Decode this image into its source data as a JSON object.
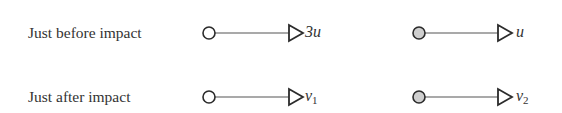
{
  "diagram": {
    "rows": [
      {
        "label": "Just before impact",
        "particle_a": {
          "fill": "#ffffff",
          "velocity_symbol": "3u",
          "velocity_sub": ""
        },
        "particle_b": {
          "fill": "#cfcfcf",
          "velocity_symbol": "u",
          "velocity_sub": ""
        }
      },
      {
        "label": "Just after impact",
        "particle_a": {
          "fill": "#ffffff",
          "velocity_symbol": "v",
          "velocity_sub": "1"
        },
        "particle_b": {
          "fill": "#cfcfcf",
          "velocity_symbol": "v",
          "velocity_sub": "2"
        }
      }
    ],
    "colors": {
      "stroke": "#2b2b2b",
      "line": "#555555",
      "light_particle": "#ffffff",
      "shaded_particle": "#cfcfcf"
    }
  }
}
